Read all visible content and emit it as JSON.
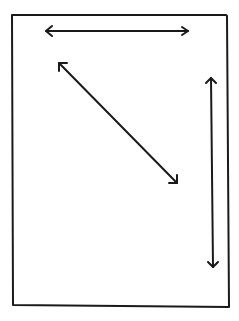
{
  "diagram": {
    "stroke_color": "#1a1a1a",
    "background": "#ffffff",
    "frame": {
      "x1": 12,
      "y1": 15,
      "x2": 229,
      "y2": 307
    },
    "arrows": [
      {
        "name": "horizontal",
        "x1": 46,
        "y1": 31,
        "x2": 188,
        "y2": 31
      },
      {
        "name": "diagonal",
        "x1": 59,
        "y1": 63,
        "x2": 177,
        "y2": 183
      },
      {
        "name": "vertical",
        "x1": 211,
        "y1": 78,
        "x2": 214,
        "y2": 267
      }
    ]
  }
}
